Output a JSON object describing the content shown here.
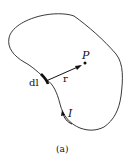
{
  "diagram": {
    "labels": {
      "point": "P",
      "vector_r": "r",
      "element": "dl",
      "current": "I",
      "caption": "(a)"
    },
    "colors": {
      "stroke": "#222222",
      "background": "#ffffff"
    }
  }
}
